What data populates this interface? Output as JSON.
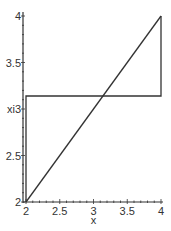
{
  "chart_data": {
    "type": "line",
    "title": "",
    "xlabel": "x",
    "ylabel": "",
    "xlim": [
      2,
      4
    ],
    "ylim": [
      2,
      4
    ],
    "grid": false,
    "legend": null,
    "x_ticks": [
      {
        "value": 2,
        "label": "2"
      },
      {
        "value": 2.5,
        "label": "2.5"
      },
      {
        "value": 3,
        "label": "3"
      },
      {
        "value": 3.5,
        "label": "3.5"
      },
      {
        "value": 4,
        "label": "4"
      }
    ],
    "y_ticks": [
      {
        "value": 2,
        "label": "2"
      },
      {
        "value": 2.5,
        "label": "2.5"
      },
      {
        "value": 3,
        "label": "xi3"
      },
      {
        "value": 3.5,
        "label": "3.5"
      },
      {
        "value": 4,
        "label": "4"
      }
    ],
    "series": [
      {
        "name": "diagonal",
        "color": "#333333",
        "points": [
          [
            2,
            2
          ],
          [
            4,
            4
          ]
        ]
      },
      {
        "name": "step",
        "color": "#333333",
        "points": [
          [
            2,
            2
          ],
          [
            2,
            3.14
          ],
          [
            4,
            3.14
          ],
          [
            4,
            4
          ]
        ]
      }
    ]
  },
  "colors": {
    "axis": "#333333",
    "line": "#333333",
    "background": "#ffffff"
  }
}
